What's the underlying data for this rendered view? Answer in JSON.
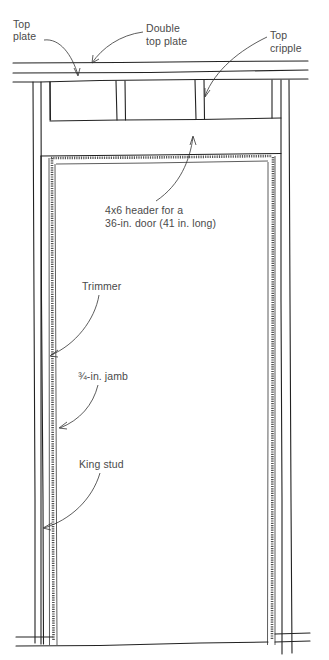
{
  "diagram": {
    "labels": {
      "top_plate": [
        "Top",
        "plate"
      ],
      "double_top_plate": [
        "Double",
        "top plate"
      ],
      "top_cripple": [
        "Top",
        "cripple"
      ],
      "header": [
        "4x6 header for a",
        "36-in. door (41 in. long)"
      ],
      "trimmer": [
        "Trimmer"
      ],
      "jamb": [
        "¾-in. jamb"
      ],
      "king_stud": [
        "King stud"
      ]
    },
    "colors": {
      "line": "#222222",
      "label": "#4a4a4a",
      "background": "#ffffff"
    }
  }
}
